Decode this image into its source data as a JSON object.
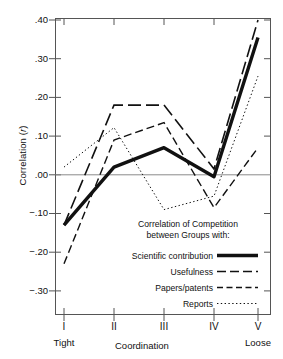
{
  "chart_data": {
    "type": "line",
    "title": "",
    "xlabel": "Coordination",
    "ylabel": "Correlation (r)",
    "categories": [
      "I",
      "II",
      "III",
      "IV",
      "V"
    ],
    "x_end_labels": {
      "left": "Tight",
      "right": "Loose"
    },
    "ylim": [
      -0.35,
      0.43
    ],
    "yticks": [
      0.4,
      0.3,
      0.2,
      0.1,
      0.0,
      -0.1,
      -0.2,
      -0.3
    ],
    "ytick_labels": [
      ".40",
      ".30",
      ".20",
      ".10",
      ".00",
      "−.10",
      "−.20",
      "−.30"
    ],
    "grid": false,
    "zero_line": true,
    "legend_position": "inside-lower-center",
    "legend_title": [
      "Correlation of Competition",
      "between Groups with:"
    ],
    "series": [
      {
        "name": "Scientific contribution",
        "style": "solid-thick",
        "values": [
          -0.13,
          0.02,
          0.07,
          -0.005,
          0.355
        ]
      },
      {
        "name": "Usefulness",
        "style": "long-dash",
        "values": [
          -0.13,
          0.18,
          0.18,
          0.015,
          0.4
        ]
      },
      {
        "name": "Papers/patents",
        "style": "medium-dash",
        "values": [
          -0.23,
          0.09,
          0.135,
          -0.085,
          0.07
        ]
      },
      {
        "name": "Reports",
        "style": "dotted",
        "values": [
          0.02,
          0.122,
          -0.09,
          -0.055,
          0.255
        ]
      }
    ]
  },
  "axis": {
    "ylabel_text": "Correlation (",
    "ylabel_italic": "r",
    "ylabel_tail": ")",
    "xlabel_text": "Coordination",
    "tight": "Tight",
    "loose": "Loose"
  },
  "legend": {
    "line1": "Correlation of Competition",
    "line2": "between Groups with:",
    "items": [
      {
        "label": "Scientific contribution"
      },
      {
        "label": "Usefulness"
      },
      {
        "label": "Papers/patents"
      },
      {
        "label": "Reports"
      }
    ]
  },
  "colors": {
    "ink": "#111111",
    "axis": "#555555",
    "zero": "#888888",
    "bg": "#ffffff"
  }
}
